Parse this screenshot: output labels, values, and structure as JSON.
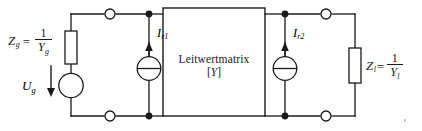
{
  "diagram": {
    "background_color": "#ffffff",
    "line_color": "#1a1a1a",
    "text_color": "#1a1a1a",
    "center_block": {
      "line1": "Leitwertmatrix",
      "line2_open": "[",
      "line2_var": "Y",
      "line2_close": "]"
    },
    "source_impedance": {
      "symbol": "Z",
      "subscript": "g",
      "equals": "=",
      "numerator": "1",
      "denominator_var": "Y",
      "denominator_sub": "g"
    },
    "load_impedance": {
      "symbol": "Z",
      "subscript": "l",
      "equals": "=",
      "numerator": "1",
      "denominator_var": "Y",
      "denominator_sub": "l"
    },
    "voltage_source": {
      "symbol": "U",
      "subscript": "g"
    },
    "current_source_left": {
      "symbol": "I",
      "subscript": "r1"
    },
    "current_source_right": {
      "symbol": "I",
      "subscript": "r2"
    }
  }
}
